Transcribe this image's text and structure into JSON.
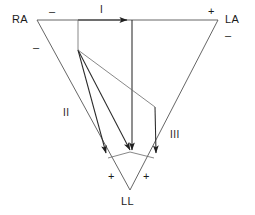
{
  "diagram": {
    "type": "ecg-lead-vector-diagram",
    "stroke_color": "#3a3a3a",
    "text_color": "#1a1a1a",
    "background_color": "#ffffff",
    "electrodes": [
      {
        "id": "RA",
        "label": "RA",
        "x": 37,
        "y": 20
      },
      {
        "id": "LA",
        "label": "LA",
        "x": 218,
        "y": 20
      },
      {
        "id": "LL",
        "label": "LL",
        "x": 130,
        "y": 190
      }
    ],
    "leads": [
      {
        "id": "I",
        "label": "I",
        "from": "RA",
        "to": "LA"
      },
      {
        "id": "II",
        "label": "II",
        "from": "RA",
        "to": "LL"
      },
      {
        "id": "III",
        "label": "III",
        "from": "LA",
        "to": "LL"
      }
    ],
    "polarity_marks": [
      {
        "id": "ra-top-minus",
        "symbol": "–",
        "lead": "I",
        "pole": "negative"
      },
      {
        "id": "la-top-plus",
        "symbol": "+",
        "lead": "I",
        "pole": "positive"
      },
      {
        "id": "ra-left-minus",
        "symbol": "–",
        "lead": "II",
        "pole": "negative"
      },
      {
        "id": "la-right-minus",
        "symbol": "–",
        "lead": "III",
        "pole": "negative"
      },
      {
        "id": "ll-left-plus",
        "symbol": "+",
        "lead": "II",
        "pole": "positive"
      },
      {
        "id": "ll-right-plus",
        "symbol": "+",
        "lead": "III",
        "pole": "positive"
      }
    ],
    "labels": {
      "ra": "RA",
      "la": "LA",
      "ll": "LL",
      "lead_i": "I",
      "lead_ii": "II",
      "lead_iii": "III",
      "minus": "–",
      "plus": "+"
    }
  }
}
